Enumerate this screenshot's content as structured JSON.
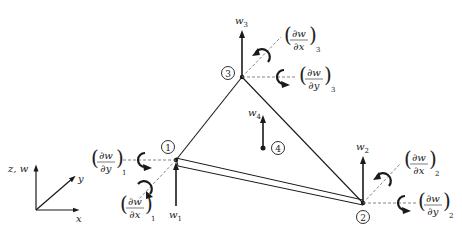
{
  "figure": {
    "stroke_color": "#1a1a1a",
    "dash_color": "#555555"
  },
  "axes": {
    "z_label": "z, w",
    "y_label": "y",
    "x_label": "x"
  },
  "nodes": [
    {
      "id": "1",
      "label": "1",
      "w": "w",
      "w_sub": "1",
      "dwdx": "∂w/∂x",
      "dwdx_sub": "1",
      "dwdy": "∂w/∂y",
      "dwdy_sub": "1"
    },
    {
      "id": "2",
      "label": "2",
      "w": "w",
      "w_sub": "2",
      "dwdx": "∂w/∂x",
      "dwdx_sub": "2",
      "dwdy": "∂w/∂y",
      "dwdy_sub": "2"
    },
    {
      "id": "3",
      "label": "3",
      "w": "w",
      "w_sub": "3",
      "dwdx": "∂w/∂x",
      "dwdx_sub": "3",
      "dwdy": "∂w/∂y",
      "dwdy_sub": "3"
    },
    {
      "id": "4",
      "label": "4",
      "w": "w",
      "w_sub": "4"
    }
  ],
  "frac": {
    "num": "∂w",
    "den_x": "∂x",
    "den_y": "∂y"
  }
}
